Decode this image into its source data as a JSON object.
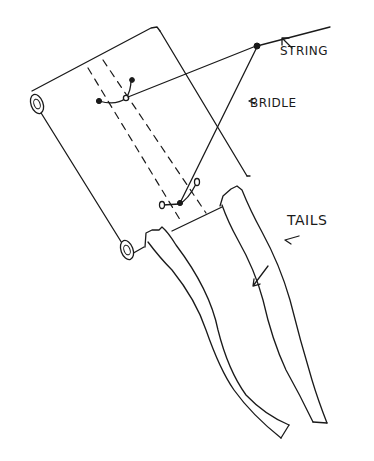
{
  "diagram": {
    "kind": "hand-drawn kite sketch",
    "ink_color": "#1a1a1a",
    "background_color": "#ffffff",
    "labels": {
      "string": "STRING",
      "bridle": "BRIDLE",
      "tails": "TAILS"
    },
    "parts": [
      "kite-sail",
      "top-dowel-roll",
      "bottom-dowel-roll",
      "spine-fold-dashed-lines",
      "upper-bridle-ring",
      "lower-bridle-ring",
      "bridle-line",
      "string-line",
      "left-tail",
      "right-tail"
    ]
  }
}
